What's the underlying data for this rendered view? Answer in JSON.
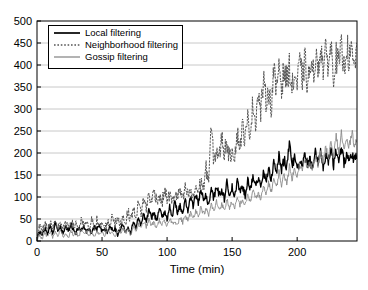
{
  "chart_data": {
    "type": "line",
    "title": "",
    "subtitle": "",
    "xlabel": "Time (min)",
    "ylabel": "",
    "xlim": [
      0,
      246
    ],
    "ylim": [
      0,
      500
    ],
    "xticks": [
      0,
      50,
      100,
      150,
      200
    ],
    "yticks": [
      0,
      50,
      100,
      150,
      200,
      250,
      300,
      350,
      400,
      450,
      500
    ],
    "xtick_labels": [
      "0",
      "50",
      "100",
      "150",
      "200"
    ],
    "ytick_labels": [
      "0",
      "50",
      "100",
      "150",
      "200",
      "250",
      "300",
      "350",
      "400",
      "450",
      "500"
    ],
    "grid": "horizontal",
    "legend_position": "upper-left-inside",
    "legend_entries": [
      "Local filtering",
      "Neighborhood filtering",
      "Gossip filtering"
    ],
    "series": [
      {
        "name": "Local filtering",
        "style": "solid",
        "color": "#000000",
        "width": 1.3,
        "x": [
          0,
          2,
          4,
          6,
          8,
          10,
          12,
          14,
          16,
          18,
          20,
          22,
          24,
          26,
          28,
          30,
          32,
          34,
          36,
          38,
          40,
          42,
          44,
          46,
          48,
          50,
          52,
          54,
          56,
          58,
          60,
          62,
          64,
          66,
          68,
          70,
          72,
          74,
          76,
          78,
          80,
          82,
          84,
          86,
          88,
          90,
          92,
          94,
          96,
          98,
          100,
          102,
          104,
          106,
          108,
          110,
          112,
          114,
          116,
          118,
          120,
          122,
          124,
          126,
          128,
          130,
          132,
          134,
          136,
          138,
          140,
          142,
          144,
          146,
          148,
          150,
          152,
          154,
          156,
          158,
          160,
          162,
          164,
          166,
          168,
          170,
          172,
          174,
          176,
          178,
          180,
          182,
          184,
          186,
          188,
          190,
          192,
          194,
          196,
          198,
          200,
          202,
          204,
          206,
          208,
          210,
          212,
          214,
          216,
          218,
          220,
          222,
          224,
          226,
          228,
          230,
          232,
          234,
          236,
          238,
          240,
          242,
          244,
          246
        ],
        "values": [
          5,
          22,
          12,
          30,
          18,
          34,
          20,
          38,
          24,
          30,
          16,
          34,
          22,
          40,
          26,
          18,
          32,
          24,
          36,
          20,
          30,
          14,
          34,
          26,
          40,
          22,
          30,
          18,
          36,
          24,
          30,
          14,
          28,
          38,
          22,
          34,
          18,
          44,
          30,
          52,
          38,
          62,
          46,
          70,
          54,
          62,
          48,
          72,
          56,
          66,
          50,
          78,
          58,
          88,
          66,
          80,
          58,
          92,
          70,
          100,
          78,
          108,
          84,
          116,
          92,
          104,
          80,
          118,
          96,
          128,
          104,
          118,
          96,
          132,
          108,
          122,
          98,
          136,
          112,
          126,
          104,
          140,
          118,
          150,
          128,
          142,
          120,
          156,
          134,
          168,
          142,
          176,
          152,
          196,
          160,
          186,
          166,
          228,
          172,
          190,
          160,
          178,
          168,
          196,
          174,
          186,
          160,
          200,
          176,
          206,
          168,
          196,
          180,
          210,
          172,
          204,
          186,
          214,
          178,
          196,
          188,
          200,
          182,
          192
        ]
      },
      {
        "name": "Neighborhood filtering",
        "style": "dotted",
        "color": "#555555",
        "width": 1.0,
        "x": [
          0,
          2,
          4,
          6,
          8,
          10,
          12,
          14,
          16,
          18,
          20,
          22,
          24,
          26,
          28,
          30,
          32,
          34,
          36,
          38,
          40,
          42,
          44,
          46,
          48,
          50,
          52,
          54,
          56,
          58,
          60,
          62,
          64,
          66,
          68,
          70,
          72,
          74,
          76,
          78,
          80,
          82,
          84,
          86,
          88,
          90,
          92,
          94,
          96,
          98,
          100,
          102,
          104,
          106,
          108,
          110,
          112,
          114,
          116,
          118,
          120,
          122,
          124,
          126,
          128,
          130,
          132,
          134,
          136,
          138,
          140,
          142,
          144,
          146,
          148,
          150,
          152,
          154,
          156,
          158,
          160,
          162,
          164,
          166,
          168,
          170,
          172,
          174,
          176,
          178,
          180,
          182,
          184,
          186,
          188,
          190,
          192,
          194,
          196,
          198,
          200,
          202,
          204,
          206,
          208,
          210,
          212,
          214,
          216,
          218,
          220,
          222,
          224,
          226,
          228,
          230,
          232,
          234,
          236,
          238,
          240,
          242,
          244,
          246
        ],
        "values": [
          10,
          34,
          20,
          42,
          28,
          46,
          24,
          40,
          30,
          44,
          26,
          38,
          30,
          46,
          32,
          42,
          28,
          44,
          34,
          40,
          26,
          46,
          32,
          48,
          30,
          42,
          26,
          44,
          36,
          62,
          40,
          48,
          34,
          58,
          42,
          66,
          50,
          72,
          56,
          86,
          64,
          96,
          74,
          108,
          86,
          118,
          92,
          104,
          84,
          116,
          96,
          104,
          88,
          110,
          98,
          116,
          90,
          120,
          104,
          112,
          96,
          126,
          110,
          138,
          120,
          164,
          140,
          262,
          176,
          210,
          186,
          238,
          200,
          230,
          184,
          210,
          196,
          244,
          214,
          260,
          230,
          276,
          248,
          316,
          268,
          340,
          292,
          364,
          320,
          348,
          300,
          392,
          332,
          410,
          350,
          390,
          362,
          398,
          344,
          380,
          356,
          404,
          368,
          412,
          352,
          398,
          374,
          422,
          386,
          448,
          394,
          426,
          404,
          440,
          382,
          418,
          400,
          436,
          392,
          448,
          410,
          428,
          388,
          450
        ]
      },
      {
        "name": "Gossip filtering",
        "style": "solid",
        "color": "#8a8a8a",
        "width": 0.9,
        "x": [
          0,
          2,
          4,
          6,
          8,
          10,
          12,
          14,
          16,
          18,
          20,
          22,
          24,
          26,
          28,
          30,
          32,
          34,
          36,
          38,
          40,
          42,
          44,
          46,
          48,
          50,
          52,
          54,
          56,
          58,
          60,
          62,
          64,
          66,
          68,
          70,
          72,
          74,
          76,
          78,
          80,
          82,
          84,
          86,
          88,
          90,
          92,
          94,
          96,
          98,
          100,
          102,
          104,
          106,
          108,
          110,
          112,
          114,
          116,
          118,
          120,
          122,
          124,
          126,
          128,
          130,
          132,
          134,
          136,
          138,
          140,
          142,
          144,
          146,
          148,
          150,
          152,
          154,
          156,
          158,
          160,
          162,
          164,
          166,
          168,
          170,
          172,
          174,
          176,
          178,
          180,
          182,
          184,
          186,
          188,
          190,
          192,
          194,
          196,
          198,
          200,
          202,
          204,
          206,
          208,
          210,
          212,
          214,
          216,
          218,
          220,
          222,
          224,
          226,
          228,
          230,
          232,
          234,
          236,
          238,
          240,
          242,
          244,
          246
        ],
        "values": [
          2,
          12,
          6,
          18,
          10,
          22,
          8,
          20,
          12,
          24,
          10,
          18,
          8,
          22,
          14,
          20,
          10,
          24,
          16,
          22,
          12,
          20,
          10,
          24,
          14,
          22,
          12,
          26,
          16,
          22,
          10,
          24,
          14,
          30,
          18,
          26,
          14,
          34,
          22,
          38,
          28,
          44,
          32,
          48,
          36,
          42,
          30,
          48,
          38,
          44,
          32,
          52,
          40,
          46,
          36,
          54,
          42,
          58,
          46,
          64,
          52,
          70,
          56,
          78,
          62,
          72,
          58,
          84,
          66,
          90,
          72,
          84,
          68,
          94,
          76,
          88,
          72,
          98,
          82,
          94,
          80,
          106,
          88,
          116,
          96,
          110,
          92,
          124,
          104,
          134,
          112,
          142,
          120,
          156,
          128,
          150,
          134,
          168,
          142,
          162,
          150,
          178,
          158,
          186,
          164,
          178,
          166,
          192,
          172,
          200,
          178,
          212,
          186,
          224,
          192,
          238,
          200,
          246,
          206,
          230,
          212,
          252,
          218,
          228
        ]
      }
    ]
  },
  "axis": {
    "xlabel": "Time (min)",
    "xtick_labels": [
      "0",
      "50",
      "100",
      "150",
      "200"
    ],
    "ytick_labels": [
      "500",
      "450",
      "400",
      "350",
      "300",
      "250",
      "200",
      "150",
      "100",
      "50",
      "0"
    ]
  },
  "legend": {
    "items": [
      {
        "label": "Local filtering"
      },
      {
        "label": "Neighborhood filtering"
      },
      {
        "label": "Gossip filtering"
      }
    ]
  },
  "colors": {
    "local": "#000000",
    "neighborhood": "#555555",
    "gossip": "#8a8a8a",
    "grid": "#c8c8c8",
    "axis": "#000000",
    "background": "#ffffff"
  }
}
